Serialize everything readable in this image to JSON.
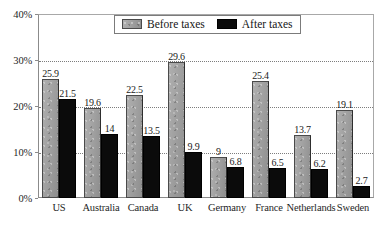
{
  "chart_data": {
    "type": "bar",
    "title": "",
    "xlabel": "",
    "ylabel": "",
    "ylim": [
      0,
      40
    ],
    "ytick_labels": [
      "0%",
      "10%",
      "20%",
      "30%",
      "40%"
    ],
    "ytick_values": [
      0,
      10,
      20,
      30,
      40
    ],
    "grid": "horizontal dotted gridlines at 10%, 20%, 30%",
    "legend_position": "top-center",
    "categories": [
      "US",
      "Australia",
      "Canada",
      "UK",
      "Germany",
      "France",
      "Netherlands",
      "Sweden"
    ],
    "series": [
      {
        "name": "Before taxes",
        "color": "#9e9e9e",
        "values": [
          25.9,
          19.6,
          22.5,
          29.6,
          9,
          25.4,
          13.7,
          19.1
        ],
        "value_labels": [
          "25.9",
          "19.6",
          "22.5",
          "29.6",
          "9",
          "25.4",
          "13.7",
          "19.1"
        ]
      },
      {
        "name": "After taxes",
        "color": "#0b0b0b",
        "values": [
          21.5,
          14,
          13.5,
          9.9,
          6.8,
          6.5,
          6.2,
          2.7
        ],
        "value_labels": [
          "21.5",
          "14",
          "13.5",
          "9.9",
          "6.8",
          "6.5",
          "6.2",
          "2.7"
        ]
      }
    ]
  },
  "legend": {
    "items": [
      {
        "label": "Before taxes",
        "swatch": "before"
      },
      {
        "label": "After taxes",
        "swatch": "after"
      }
    ]
  }
}
